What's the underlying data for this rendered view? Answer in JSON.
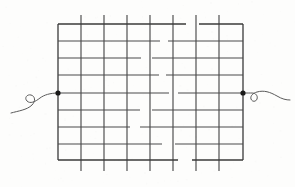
{
  "figure": {
    "type": "technical-line-drawing",
    "background_color": "#fdfdfc",
    "line_color": "#4a4a4a",
    "border_color": "#3a3a3a",
    "terminal_color": "#1a1a1a",
    "lead_color": "#5a5a5a",
    "canvas": {
      "width": 295,
      "height": 187
    }
  },
  "grid": {
    "name": "wire-mesh-grid",
    "left": 58,
    "top": 24,
    "right": 243,
    "bottom": 160,
    "columns": 8,
    "rows": 8,
    "vertical_lines_x": [
      58,
      81,
      104,
      127,
      150,
      173,
      196,
      219,
      243
    ],
    "horizontal_lines_y": [
      24,
      41,
      58,
      75,
      93,
      110,
      127,
      144,
      160
    ],
    "vertical_overhang_top": 9,
    "vertical_overhang_bottom": 11,
    "overhang_line_indices": [
      1,
      2,
      3,
      4,
      5,
      6,
      7
    ],
    "breaks": [
      {
        "line": "horizontal",
        "y": 24,
        "x_start": 186,
        "x_end": 199
      },
      {
        "line": "horizontal",
        "y": 41,
        "x_start": 160,
        "x_end": 168
      },
      {
        "line": "horizontal",
        "y": 58,
        "x_start": 141,
        "x_end": 152
      },
      {
        "line": "horizontal",
        "y": 75,
        "x_start": 159,
        "x_end": 166
      },
      {
        "line": "horizontal",
        "y": 93,
        "x_start": 169,
        "x_end": 178
      },
      {
        "line": "horizontal",
        "y": 110,
        "x_start": 140,
        "x_end": 152
      },
      {
        "line": "horizontal",
        "y": 127,
        "x_start": 130,
        "x_end": 140
      },
      {
        "line": "horizontal",
        "y": 144,
        "x_start": 162,
        "x_end": 175
      },
      {
        "line": "horizontal",
        "y": 160,
        "x_start": 178,
        "x_end": 192
      }
    ]
  },
  "terminals": [
    {
      "name": "left-terminal",
      "cx": 58,
      "cy": 93,
      "radius": 2.6,
      "side": "left"
    },
    {
      "name": "right-terminal",
      "cx": 243,
      "cy": 93,
      "radius": 2.6,
      "side": "right"
    }
  ],
  "leads": [
    {
      "name": "left-lead-wire",
      "side": "left",
      "path": "M 58 93 C 50 93 44 95 40 98 C 35 102 30 104 27 101 C 24 98 27 94 31 95 C 35 96 36 101 32 105 C 27 110 18 111 11 113",
      "loop_center_x": 30,
      "loop_center_y": 99
    },
    {
      "name": "right-lead-wire",
      "side": "right",
      "path": "M 243 93 C 247 93 250 93 252 93 C 256 93 258 96 257 99 C 256 102 252 102 251 99 C 250 96 253 93 257 92 C 264 90 270 92 277 96 C 282 99 286 100 290 100",
      "loop_center_x": 253,
      "loop_center_y": 96
    }
  ]
}
